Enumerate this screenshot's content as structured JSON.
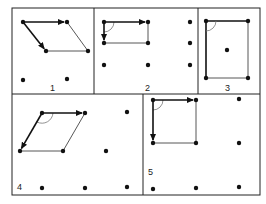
{
  "figure": {
    "colors": {
      "ink": "#111111",
      "thin": "#444444",
      "bg": "#ffffff"
    },
    "border": {
      "x": 12,
      "y": 8,
      "w": 248,
      "h": 187
    },
    "dividers": [
      {
        "x1": 12,
        "y1": 94,
        "x2": 260,
        "y2": 94
      },
      {
        "x1": 94,
        "y1": 8,
        "x2": 94,
        "y2": 94
      },
      {
        "x1": 198,
        "y1": 8,
        "x2": 198,
        "y2": 94
      },
      {
        "x1": 143,
        "y1": 94,
        "x2": 143,
        "y2": 195
      }
    ],
    "panels": [
      {
        "label": "1",
        "label_pos": [
          50,
          91
        ],
        "dots": [
          [
            23,
            22
          ],
          [
            67,
            22
          ],
          [
            46,
            51
          ],
          [
            88,
            51
          ],
          [
            23,
            80
          ],
          [
            67,
            79
          ]
        ],
        "thin_lines": [
          [
            [
              67,
              22
            ],
            [
              88,
              51
            ]
          ],
          [
            [
              46,
              51
            ],
            [
              88,
              51
            ]
          ]
        ],
        "arrows": [
          [
            [
              23,
              22
            ],
            [
              67,
              22
            ]
          ],
          [
            [
              23,
              22
            ],
            [
              46,
              51
            ]
          ]
        ],
        "arc": null,
        "bold_lines": []
      },
      {
        "label": "2",
        "label_pos": [
          145,
          91
        ],
        "dots": [
          [
            104,
            22
          ],
          [
            148,
            22
          ],
          [
            104,
            43
          ],
          [
            148,
            43
          ],
          [
            104,
            65
          ],
          [
            148,
            65
          ],
          [
            190,
            22
          ],
          [
            190,
            43
          ],
          [
            190,
            65
          ]
        ],
        "thin_lines": [
          [
            [
              148,
              22
            ],
            [
              148,
              43
            ]
          ],
          [
            [
              104,
              43
            ],
            [
              148,
              43
            ]
          ]
        ],
        "arrows": [
          [
            [
              104,
              22
            ],
            [
              148,
              22
            ]
          ],
          [
            [
              104,
              22
            ],
            [
              104,
              43
            ]
          ]
        ],
        "arc": {
          "cx": 104,
          "cy": 22,
          "r": 10,
          "from": [
            114,
            22
          ],
          "to": [
            104,
            32
          ]
        },
        "bold_lines": []
      },
      {
        "label": "3",
        "label_pos": [
          225,
          91
        ],
        "dots": [
          [
            206,
            21
          ],
          [
            248,
            21
          ],
          [
            206,
            78
          ],
          [
            248,
            78
          ],
          [
            227,
            50
          ]
        ],
        "thin_lines": [
          [
            [
              248,
              21
            ],
            [
              248,
              78
            ]
          ],
          [
            [
              206,
              78
            ],
            [
              248,
              78
            ]
          ]
        ],
        "arrows": [],
        "arc": {
          "cx": 206,
          "cy": 21,
          "r": 10,
          "from": [
            216,
            21
          ],
          "to": [
            206,
            31
          ]
        },
        "bold_lines": [
          [
            [
              206,
              21
            ],
            [
              248,
              21
            ]
          ],
          [
            [
              206,
              21
            ],
            [
              206,
              78
            ]
          ]
        ]
      },
      {
        "label": "4",
        "label_pos": [
          17,
          190
        ],
        "dots": [
          [
            42,
            113
          ],
          [
            85,
            113
          ],
          [
            127,
            112
          ],
          [
            20,
            151
          ],
          [
            63,
            151
          ],
          [
            106,
            151
          ],
          [
            42,
            188
          ],
          [
            85,
            188
          ],
          [
            127,
            187
          ]
        ],
        "thin_lines": [
          [
            [
              85,
              113
            ],
            [
              63,
              151
            ]
          ],
          [
            [
              20,
              151
            ],
            [
              63,
              151
            ]
          ]
        ],
        "arrows": [
          [
            [
              42,
              113
            ],
            [
              85,
              113
            ]
          ],
          [
            [
              42,
              113
            ],
            [
              20,
              151
            ]
          ]
        ],
        "arc": {
          "cx": 42,
          "cy": 113,
          "r": 11,
          "from": [
            53,
            113
          ],
          "to": [
            37,
            122
          ]
        },
        "bold_lines": []
      },
      {
        "label": "5",
        "label_pos": [
          148,
          175
        ],
        "dots": [
          [
            153,
            100
          ],
          [
            196,
            100
          ],
          [
            239,
            99
          ],
          [
            153,
            143
          ],
          [
            196,
            143
          ],
          [
            239,
            143
          ],
          [
            153,
            189
          ],
          [
            196,
            188
          ],
          [
            239,
            187
          ]
        ],
        "thin_lines": [
          [
            [
              196,
              100
            ],
            [
              196,
              143
            ]
          ],
          [
            [
              153,
              143
            ],
            [
              196,
              143
            ]
          ]
        ],
        "arrows": [
          [
            [
              153,
              100
            ],
            [
              196,
              100
            ]
          ],
          [
            [
              153,
              100
            ],
            [
              153,
              143
            ]
          ]
        ],
        "arc": {
          "cx": 153,
          "cy": 100,
          "r": 10,
          "from": [
            163,
            100
          ],
          "to": [
            153,
            110
          ]
        },
        "bold_lines": []
      }
    ]
  }
}
